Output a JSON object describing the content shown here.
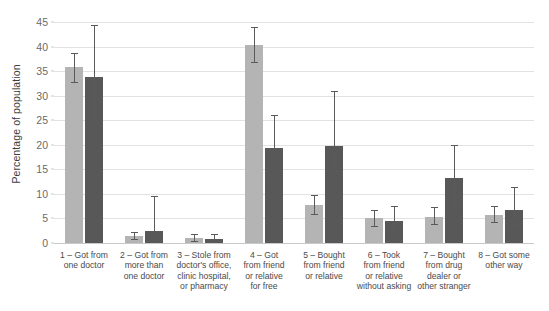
{
  "chart_data": {
    "type": "bar",
    "title": "",
    "xlabel": "",
    "ylabel": "Percentage of population",
    "ylim": [
      0,
      45
    ],
    "ytick_step": 5,
    "yticks": [
      "0",
      "5",
      "10",
      "15",
      "20",
      "25",
      "30",
      "35",
      "40",
      "45"
    ],
    "grid": true,
    "legend": "none",
    "orientation": "vertical",
    "error_bars": "95% CI",
    "colors": {
      "series_1": "#b4b4b4",
      "series_2": "#585858",
      "gridline": "#e2e2e2",
      "axis": "#c9c9c9",
      "text": "#4a4a4a"
    },
    "categories": [
      "1 – Got from\none doctor",
      "2 – Got from\nmore than\none doctor",
      "3 – Stole from\ndoctor's office,\nclinic hospital,\nor pharmacy",
      "4 – Got\nfrom friend\nor relative\nfor free",
      "5 – Bought\nfrom friend\nor relative",
      "6 – Took\nfrom friend\nor relative\nwithout asking",
      "7 – Bought\nfrom drug\ndealer or\nother stranger",
      "8 – Got some\nother way"
    ],
    "series": [
      {
        "name": "series_1",
        "color": "#b4b4b4",
        "values": [
          35.9,
          1.5,
          1.1,
          40.4,
          7.8,
          5.0,
          5.3,
          5.8
        ],
        "err_low": [
          32.8,
          0.8,
          0.5,
          36.9,
          6.0,
          3.4,
          3.8,
          4.3
        ],
        "err_high": [
          38.6,
          2.3,
          1.8,
          44.0,
          9.8,
          6.8,
          7.4,
          7.5
        ]
      },
      {
        "name": "series_2",
        "color": "#585858",
        "values": [
          33.9,
          2.4,
          0.9,
          19.3,
          19.8,
          4.5,
          13.2,
          6.7
        ],
        "err_low": [
          24.9,
          0.6,
          0.2,
          12.9,
          14.6,
          2.4,
          7.9,
          3.9
        ],
        "err_high": [
          44.3,
          9.6,
          1.9,
          26.0,
          30.9,
          7.6,
          20.0,
          11.4
        ]
      }
    ]
  }
}
